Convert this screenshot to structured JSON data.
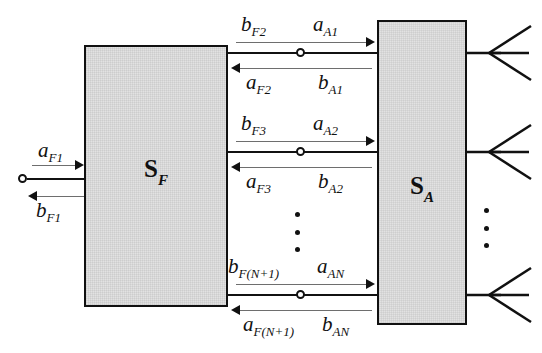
{
  "diagram": {
    "blocks": [
      {
        "id": "feed",
        "label_main": "S",
        "label_sub": "F",
        "name": "feed-network-block"
      },
      {
        "id": "antenna",
        "label_main": "S",
        "label_sub": "A",
        "name": "antenna-array-block"
      }
    ],
    "input_port": {
      "incident_base": "a",
      "incident_sub": "F1",
      "reflected_base": "b",
      "reflected_sub": "F1"
    },
    "rows": [
      {
        "index": 1,
        "top_left_base": "b",
        "top_left_sub": "F2",
        "top_right_base": "a",
        "top_right_sub": "A1",
        "bottom_left_base": "a",
        "bottom_left_sub": "F2",
        "bottom_right_base": "b",
        "bottom_right_sub": "A1"
      },
      {
        "index": 2,
        "top_left_base": "b",
        "top_left_sub": "F3",
        "top_right_base": "a",
        "top_right_sub": "A2",
        "bottom_left_base": "a",
        "bottom_left_sub": "F3",
        "bottom_right_base": "b",
        "bottom_right_sub": "A2"
      },
      {
        "index": 3,
        "top_left_base": "b",
        "top_left_sub": "F(N+1)",
        "top_right_base": "a",
        "top_right_sub": "AN",
        "bottom_left_base": "a",
        "bottom_left_sub": "F(N+1)",
        "bottom_right_base": "b",
        "bottom_right_sub": "AN"
      }
    ],
    "ellipsis": {
      "middle_dots": 3,
      "right_dots": 3
    },
    "antennas": [
      {
        "index": 1,
        "name": "antenna-element-1"
      },
      {
        "index": 2,
        "name": "antenna-element-2"
      },
      {
        "index": 3,
        "name": "antenna-element-n"
      }
    ],
    "colors": {
      "stroke": "#111111",
      "thin_stroke": "#6e6e6e",
      "block_fill": "#e2e2e2",
      "background": "#ffffff"
    }
  }
}
